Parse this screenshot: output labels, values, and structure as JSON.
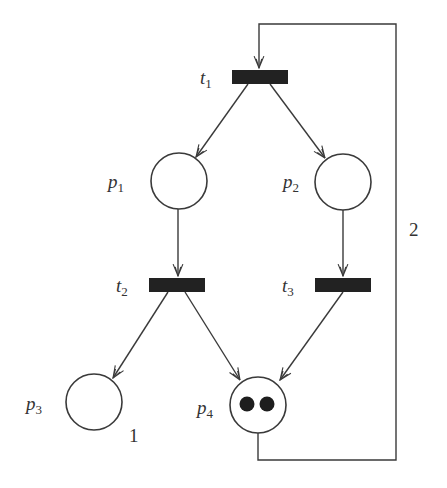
{
  "diagram": {
    "type": "petri-net",
    "places": [
      {
        "id": "p1",
        "name": "p",
        "sub": "1",
        "tokens": 0
      },
      {
        "id": "p2",
        "name": "p",
        "sub": "2",
        "tokens": 0
      },
      {
        "id": "p3",
        "name": "p",
        "sub": "3",
        "tokens": 0
      },
      {
        "id": "p4",
        "name": "p",
        "sub": "4",
        "tokens": 2
      }
    ],
    "transitions": [
      {
        "id": "t1",
        "name": "t",
        "sub": "1"
      },
      {
        "id": "t2",
        "name": "t",
        "sub": "2"
      },
      {
        "id": "t3",
        "name": "t",
        "sub": "3"
      }
    ],
    "arcs": [
      {
        "from": "t1",
        "to": "p1",
        "weight": 1
      },
      {
        "from": "t1",
        "to": "p2",
        "weight": 1
      },
      {
        "from": "p1",
        "to": "t2",
        "weight": 1
      },
      {
        "from": "p2",
        "to": "t3",
        "weight": 1
      },
      {
        "from": "t2",
        "to": "p3",
        "weight": 1
      },
      {
        "from": "t2",
        "to": "p4",
        "weight": 1
      },
      {
        "from": "t3",
        "to": "p4",
        "weight": 1
      },
      {
        "from": "p4",
        "to": "t1",
        "weight": 2
      }
    ],
    "annotations": {
      "loop_weight": "2",
      "p3_label": "1"
    }
  }
}
